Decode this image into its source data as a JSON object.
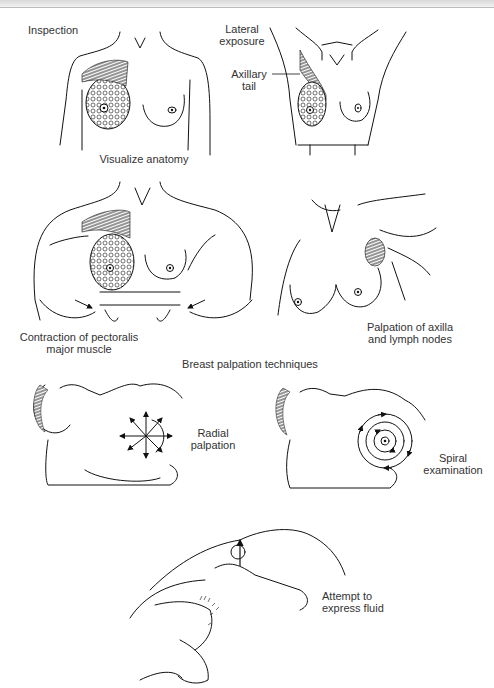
{
  "figure": {
    "panels": [
      {
        "id": "inspection",
        "title": "Inspection",
        "caption": "Visualize anatomy"
      },
      {
        "id": "lateral-exposure",
        "title": "Lateral\nexposure",
        "callout": "Axillary\ntail"
      },
      {
        "id": "pectoralis-contraction",
        "caption": "Contraction of pectoralis\nmajor muscle"
      },
      {
        "id": "axilla-palpation",
        "caption": "Palpation of axilla\nand lymph nodes"
      },
      {
        "id": "radial-palpation",
        "caption": "Radial\npalpation"
      },
      {
        "id": "spiral-examination",
        "caption": "Spiral\nexamination"
      },
      {
        "id": "express-fluid",
        "caption": "Attempt to\nexpress fluid"
      }
    ],
    "section_heading": "Breast palpation techniques"
  }
}
